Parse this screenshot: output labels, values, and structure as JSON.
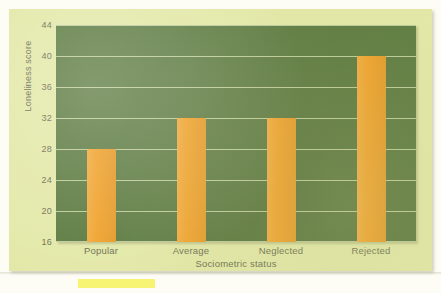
{
  "chart_data": {
    "type": "bar",
    "title": "",
    "subtitle": "",
    "xlabel": "Sociometric status",
    "ylabel": "Loneliness score",
    "categories": [
      "Popular",
      "Average",
      "Neglected",
      "Rejected"
    ],
    "values": [
      28,
      32,
      32,
      40
    ],
    "series": [
      {
        "name": "Loneliness score",
        "values": [
          28,
          32,
          32,
          40
        ]
      }
    ],
    "ylim": [
      16,
      44
    ],
    "ytick_step": 4,
    "yticks": [
      "44",
      "40",
      "36",
      "32",
      "28",
      "24",
      "20",
      "16"
    ],
    "ytick_values": [
      44,
      40,
      36,
      32,
      28,
      24,
      20,
      16
    ],
    "grid": true,
    "grid_axis": "y",
    "legend": false,
    "legend_position": "none",
    "annotations": []
  },
  "colors": {
    "page_background": "#fdfdf6",
    "card_background": "#e3e8a8",
    "plot_background": "#5d7b41",
    "bar_fill": "#f0a22c",
    "gridline": "#e2e9be",
    "axis_text": "#6e6f52",
    "highlighter": "#f6f36a"
  }
}
